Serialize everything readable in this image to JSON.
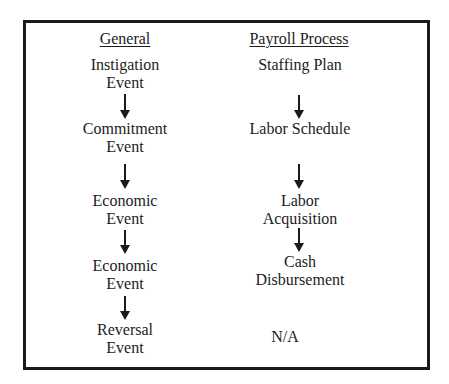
{
  "diagram": {
    "type": "two-column flow comparison",
    "columns": [
      {
        "header": "General",
        "steps": [
          {
            "lines": [
              "Instigation",
              "Event"
            ]
          },
          {
            "lines": [
              "Commitment",
              "Event"
            ]
          },
          {
            "lines": [
              "Economic",
              "Event"
            ]
          },
          {
            "lines": [
              "Economic",
              "Event"
            ]
          },
          {
            "lines": [
              "Reversal",
              "Event"
            ]
          }
        ]
      },
      {
        "header": "Payroll Process",
        "steps": [
          {
            "lines": [
              "Staffing Plan"
            ]
          },
          {
            "lines": [
              "Labor Schedule"
            ]
          },
          {
            "lines": [
              "Labor",
              "Acquisition"
            ]
          },
          {
            "lines": [
              "Cash",
              "Disbursement"
            ]
          },
          {
            "lines": [
              "N/A"
            ]
          }
        ]
      }
    ],
    "arrows": {
      "general": 4,
      "payroll": 3
    },
    "colors": {
      "border": "#1a1a1a",
      "text": "#1c1c1c",
      "background": "#ffffff"
    }
  }
}
